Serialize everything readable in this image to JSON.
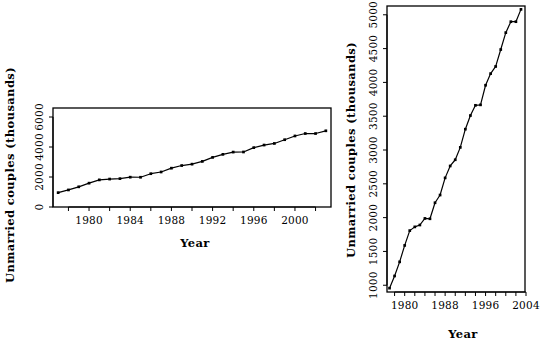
{
  "figure": {
    "background_color": "#ffffff",
    "foreground_color": "#000000",
    "panel_count": 2
  },
  "chart_data": [
    {
      "type": "line",
      "panel": "left",
      "title": "",
      "xlabel": "Year",
      "ylabel": "Unmarried couples (thousands)",
      "xlim": [
        1976.5,
        2003.5
      ],
      "ylim": [
        0,
        6600
      ],
      "grid": false,
      "legend": null,
      "x_ticks": [
        1978,
        1980,
        1982,
        1984,
        1986,
        1988,
        1990,
        1992,
        1994,
        1996,
        1998,
        2000,
        2002
      ],
      "x_tick_labels": [
        "",
        "1980",
        "",
        "1984",
        "",
        "1988",
        "",
        "1992",
        "",
        "1996",
        "",
        "2000",
        ""
      ],
      "y_ticks": [
        0,
        2000,
        4000,
        6000
      ],
      "y_tick_labels": [
        "0",
        "2000",
        "4000",
        "6000"
      ],
      "x": [
        1977,
        1978,
        1979,
        1980,
        1981,
        1982,
        1983,
        1984,
        1985,
        1986,
        1987,
        1988,
        1989,
        1990,
        1991,
        1992,
        1993,
        1994,
        1995,
        1996,
        1997,
        1998,
        1999,
        2000,
        2001,
        2002,
        2003
      ],
      "values": [
        957,
        1137,
        1346,
        1589,
        1808,
        1863,
        1891,
        1988,
        1983,
        2220,
        2334,
        2588,
        2764,
        2856,
        3039,
        3308,
        3510,
        3661,
        3668,
        3958,
        4130,
        4236,
        4486,
        4736,
        4898,
        4898,
        5080
      ]
    },
    {
      "type": "line",
      "panel": "right",
      "title": "",
      "xlabel": "Year",
      "ylabel": "Unmarried couples (thousands)",
      "xlim": [
        1976.5,
        2003.8
      ],
      "ylim": [
        900,
        5130
      ],
      "grid": false,
      "legend": null,
      "x_ticks": [
        1978,
        1980,
        1982,
        1984,
        1986,
        1988,
        1990,
        1992,
        1994,
        1996,
        1998,
        2000,
        2002,
        2004
      ],
      "x_tick_labels": [
        "",
        "1980",
        "",
        "",
        "",
        "1988",
        "",
        "",
        "",
        "1996",
        "",
        "",
        "",
        "2004"
      ],
      "y_ticks": [
        1000,
        1500,
        2000,
        2500,
        3000,
        3500,
        4000,
        4500,
        5000
      ],
      "y_tick_labels": [
        "1000",
        "1500",
        "2000",
        "2500",
        "3000",
        "3500",
        "4000",
        "4500",
        "5000"
      ],
      "x": [
        1977,
        1978,
        1979,
        1980,
        1981,
        1982,
        1983,
        1984,
        1985,
        1986,
        1987,
        1988,
        1989,
        1990,
        1991,
        1992,
        1993,
        1994,
        1995,
        1996,
        1997,
        1998,
        1999,
        2000,
        2001,
        2002,
        2003
      ],
      "values": [
        957,
        1137,
        1346,
        1589,
        1808,
        1863,
        1891,
        1988,
        1983,
        2220,
        2334,
        2588,
        2764,
        2856,
        3039,
        3308,
        3510,
        3661,
        3668,
        3958,
        4130,
        4236,
        4486,
        4736,
        4898,
        4898,
        5080
      ]
    }
  ]
}
